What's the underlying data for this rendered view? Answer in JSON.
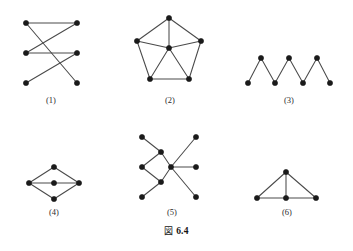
{
  "figure": {
    "caption_mark": "図",
    "caption_number": "6.4",
    "caption_full": "図 6.4",
    "background_color": "#ffffff",
    "vertex_color": "#1a1a1a",
    "edge_color": "#4a4a4a",
    "width": 353,
    "height": 251
  },
  "chart_data": {
    "type": "diagram",
    "subtitle": "",
    "panels": [
      {
        "id": "panel-1",
        "label": "(1)",
        "label_x": 51,
        "label_y": 103,
        "vertex_count": 6,
        "edge_count": 5,
        "vertices": [
          {
            "id": "L1",
            "x": 26,
            "y": 23
          },
          {
            "id": "L2",
            "x": 26,
            "y": 53
          },
          {
            "id": "L3",
            "x": 26,
            "y": 83
          },
          {
            "id": "R1",
            "x": 77,
            "y": 23
          },
          {
            "id": "R2",
            "x": 77,
            "y": 53
          },
          {
            "id": "R3",
            "x": 77,
            "y": 83
          }
        ],
        "edges": [
          [
            "L1",
            "R1"
          ],
          [
            "L2",
            "R2"
          ],
          [
            "L1",
            "R3"
          ],
          [
            "L2",
            "R1"
          ],
          [
            "L3",
            "R2"
          ]
        ]
      },
      {
        "id": "panel-2",
        "label": "(2)",
        "label_x": 170,
        "label_y": 103,
        "vertex_count": 6,
        "edge_count": 10,
        "vertices": [
          {
            "id": "T",
            "x": 169,
            "y": 18
          },
          {
            "id": "UL",
            "x": 137,
            "y": 41
          },
          {
            "id": "UR",
            "x": 201,
            "y": 41
          },
          {
            "id": "BL",
            "x": 150,
            "y": 79
          },
          {
            "id": "BR",
            "x": 189,
            "y": 79
          },
          {
            "id": "C",
            "x": 169,
            "y": 48
          }
        ],
        "edges": [
          [
            "T",
            "UL"
          ],
          [
            "T",
            "UR"
          ],
          [
            "UL",
            "BL"
          ],
          [
            "UR",
            "BR"
          ],
          [
            "BL",
            "BR"
          ],
          [
            "C",
            "T"
          ],
          [
            "C",
            "UL"
          ],
          [
            "C",
            "UR"
          ],
          [
            "C",
            "BL"
          ],
          [
            "C",
            "BR"
          ]
        ]
      },
      {
        "id": "panel-3",
        "label": "(3)",
        "label_x": 289,
        "label_y": 103,
        "vertex_count": 7,
        "edge_count": 6,
        "vertices": [
          {
            "id": "A",
            "x": 248,
            "y": 83
          },
          {
            "id": "B",
            "x": 261,
            "y": 58
          },
          {
            "id": "C",
            "x": 275,
            "y": 83
          },
          {
            "id": "D",
            "x": 289,
            "y": 58
          },
          {
            "id": "E",
            "x": 303,
            "y": 83
          },
          {
            "id": "F",
            "x": 317,
            "y": 58
          },
          {
            "id": "G",
            "x": 330,
            "y": 83
          }
        ],
        "edges": [
          [
            "A",
            "B"
          ],
          [
            "B",
            "C"
          ],
          [
            "C",
            "D"
          ],
          [
            "D",
            "E"
          ],
          [
            "E",
            "F"
          ],
          [
            "F",
            "G"
          ]
        ]
      },
      {
        "id": "panel-4",
        "label": "(4)",
        "label_x": 54,
        "label_y": 215,
        "vertex_count": 5,
        "edge_count": 6,
        "vertices": [
          {
            "id": "L",
            "x": 29,
            "y": 183
          },
          {
            "id": "T",
            "x": 54,
            "y": 167
          },
          {
            "id": "C",
            "x": 54,
            "y": 183
          },
          {
            "id": "B",
            "x": 54,
            "y": 199
          },
          {
            "id": "R",
            "x": 79,
            "y": 183
          }
        ],
        "edges": [
          [
            "L",
            "T"
          ],
          [
            "T",
            "R"
          ],
          [
            "L",
            "C"
          ],
          [
            "C",
            "R"
          ],
          [
            "L",
            "B"
          ],
          [
            "B",
            "R"
          ]
        ]
      },
      {
        "id": "panel-5",
        "label": "(5)",
        "label_x": 172,
        "label_y": 215,
        "vertex_count": 9,
        "edge_count": 8,
        "vertices": [
          {
            "id": "FLT",
            "x": 142,
            "y": 137
          },
          {
            "id": "FLM",
            "x": 142,
            "y": 167
          },
          {
            "id": "FLB",
            "x": 142,
            "y": 197
          },
          {
            "id": "MU",
            "x": 161,
            "y": 152
          },
          {
            "id": "ML",
            "x": 161,
            "y": 182
          },
          {
            "id": "H",
            "x": 171,
            "y": 167
          },
          {
            "id": "RU",
            "x": 196,
            "y": 137
          },
          {
            "id": "RM",
            "x": 196,
            "y": 167
          },
          {
            "id": "RB",
            "x": 196,
            "y": 197
          }
        ],
        "edges": [
          [
            "FLT",
            "MU"
          ],
          [
            "FLM",
            "MU"
          ],
          [
            "FLM",
            "ML"
          ],
          [
            "FLB",
            "ML"
          ],
          [
            "MU",
            "H"
          ],
          [
            "ML",
            "H"
          ],
          [
            "H",
            "RU"
          ],
          [
            "H",
            "RM"
          ],
          [
            "H",
            "RB"
          ]
        ]
      },
      {
        "id": "panel-6",
        "label": "(6)",
        "label_x": 287,
        "label_y": 215,
        "vertex_count": 4,
        "edge_count": 5,
        "vertices": [
          {
            "id": "T",
            "x": 286,
            "y": 172
          },
          {
            "id": "BL",
            "x": 257,
            "y": 198
          },
          {
            "id": "BM",
            "x": 286,
            "y": 198
          },
          {
            "id": "BR",
            "x": 316,
            "y": 198
          }
        ],
        "edges": [
          [
            "T",
            "BL"
          ],
          [
            "T",
            "BM"
          ],
          [
            "T",
            "BR"
          ],
          [
            "BL",
            "BM"
          ],
          [
            "BM",
            "BR"
          ]
        ]
      }
    ]
  }
}
